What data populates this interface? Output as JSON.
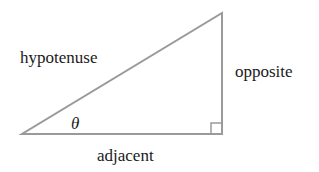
{
  "diagram": {
    "type": "right-triangle",
    "labels": {
      "hypotenuse": "hypotenuse",
      "opposite": "opposite",
      "adjacent": "adjacent",
      "angle": "θ"
    },
    "colors": {
      "stroke": "#9a9a9a",
      "text": "#1a1a1a",
      "background": "#ffffff"
    }
  }
}
